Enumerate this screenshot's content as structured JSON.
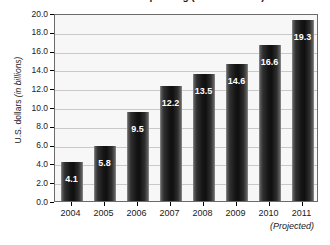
{
  "chart_data": {
    "type": "bar",
    "title": "Annual spending (in U.S. dollars)",
    "xlabel": "",
    "ylabel": "U.S. dollars (in billions)",
    "ylabel_plain": "U.S. dollars ",
    "ylabel_italic": "(in billions)",
    "categories": [
      "2004",
      "2005",
      "2006",
      "2007",
      "2008",
      "2009",
      "2010",
      "2011"
    ],
    "values": [
      4.1,
      5.8,
      9.5,
      12.2,
      13.5,
      14.6,
      16.6,
      19.3
    ],
    "value_labels": [
      "4.1",
      "5.8",
      "9.5",
      "12.2",
      "13.5",
      "14.6",
      "16.6",
      "19.3"
    ],
    "ylim": [
      0.0,
      20.0
    ],
    "ytick_values": [
      0.0,
      2.0,
      4.0,
      6.0,
      8.0,
      10.0,
      12.0,
      14.0,
      16.0,
      18.0,
      20.0
    ],
    "ytick_labels": [
      "0.0",
      "2.0",
      "4.0",
      "6.0",
      "8.0",
      "10.0",
      "12.0",
      "14.0",
      "16.0",
      "18.0",
      "20.0"
    ],
    "grid": true,
    "legend": false,
    "annotations": [
      {
        "text": "(Projected)",
        "attached_to": "2011",
        "style": "italic"
      }
    ],
    "colors": {
      "bar_fill_dark": "#101010",
      "bar_fill_edge": "#626262",
      "plot_background": "#f7f7f7",
      "gridline": "#c9c9c9",
      "axis": "#6b6b6b",
      "value_label": "#ffffff",
      "text": "#1a1a1a"
    }
  }
}
